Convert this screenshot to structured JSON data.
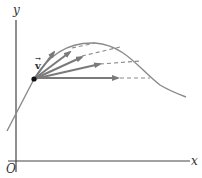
{
  "diagram": {
    "title": "",
    "axes": {
      "x_label": "x",
      "y_label": "y",
      "origin_label": "O"
    },
    "point": {
      "vector_label": "v",
      "vector_accent": "→"
    },
    "colors": {
      "axis": "#444444",
      "curve": "#8a8a8a",
      "arrows": "#7a7a7a",
      "dashed": "#8a8a8a",
      "point": "#111111"
    },
    "arrows": [
      {
        "name": "secant-arrow-1",
        "angle_desc": "steepest"
      },
      {
        "name": "secant-arrow-2",
        "angle_desc": "steep"
      },
      {
        "name": "secant-arrow-3",
        "angle_desc": "medium"
      },
      {
        "name": "secant-arrow-4",
        "angle_desc": "shallow"
      },
      {
        "name": "horizontal-arrow",
        "angle_desc": "horizontal"
      }
    ]
  }
}
